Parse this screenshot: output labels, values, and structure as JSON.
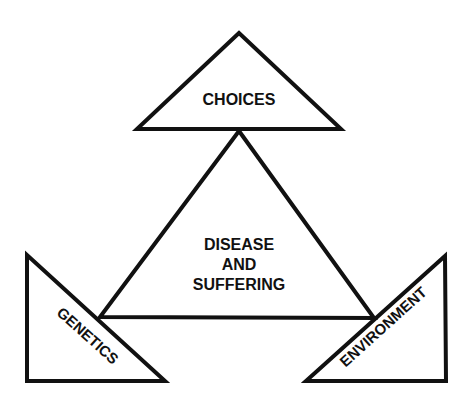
{
  "diagram": {
    "center": {
      "lines": [
        "DISEASE",
        "AND",
        "SUFFERING"
      ]
    },
    "top": {
      "label": "CHOICES"
    },
    "left": {
      "label": "GENETICS"
    },
    "right": {
      "label": "ENVIRONMENT"
    }
  },
  "colors": {
    "stroke": "#111111",
    "background": "#ffffff"
  }
}
